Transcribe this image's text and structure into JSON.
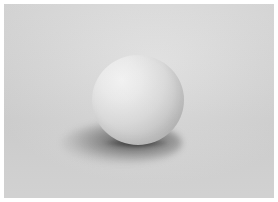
{
  "scene": {
    "description": "White sphere resting on a light gray surface with soft shadow",
    "subject": "sphere",
    "colors": {
      "border": "#ffffff",
      "background": "#d8d8d8",
      "sphere_highlight": "#f4f4f4",
      "sphere_shade": "#bcbcbc",
      "shadow": "#3a3a3a"
    }
  }
}
